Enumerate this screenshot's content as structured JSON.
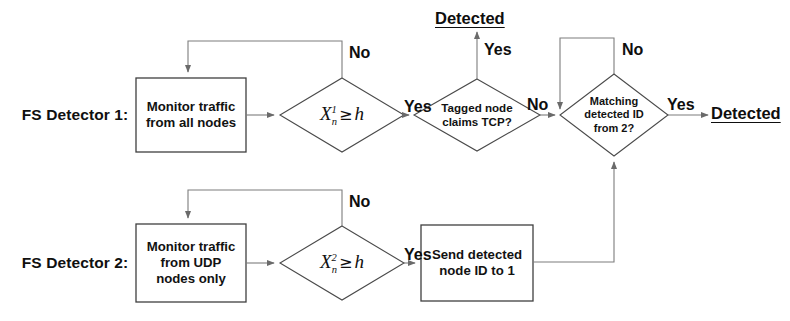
{
  "diagram": {
    "background_color": "#ffffff",
    "stroke_color": "#4d4d4d",
    "text_color": "#111111"
  },
  "rows": [
    {
      "id": "row1",
      "label": "FS Detector 1:"
    },
    {
      "id": "row2",
      "label": "FS Detector 2:"
    }
  ],
  "nodes": {
    "monitor_all": {
      "line1": "Monitor traffic",
      "line2": "from all nodes"
    },
    "monitor_udp": {
      "line1": "Monitor traffic",
      "line2": "from UDP",
      "line3": "nodes only"
    },
    "send_id": {
      "line1": "Send detected",
      "line2": "node ID to 1"
    },
    "decision1": {
      "var": "X",
      "sup": "1",
      "sub": "n",
      "op": "≥",
      "threshold": "h"
    },
    "decision2": {
      "var": "X",
      "sup": "2",
      "sub": "n",
      "op": "≥",
      "threshold": "h"
    },
    "tagged_node": {
      "line1": "Tagged node",
      "line2": "claims TCP?"
    },
    "matching_id": {
      "line1": "Matching",
      "line2": "detected ID",
      "line3": "from 2?"
    }
  },
  "edge_labels": {
    "d1_no": "No",
    "d1_yes": "Yes",
    "tagged_yes": "Yes",
    "tagged_no": "No",
    "match_no": "No",
    "match_yes": "Yes",
    "d2_no": "No",
    "d2_yes": "Yes"
  },
  "terminals": {
    "detected_top": "Detected",
    "detected_right": "Detected"
  }
}
